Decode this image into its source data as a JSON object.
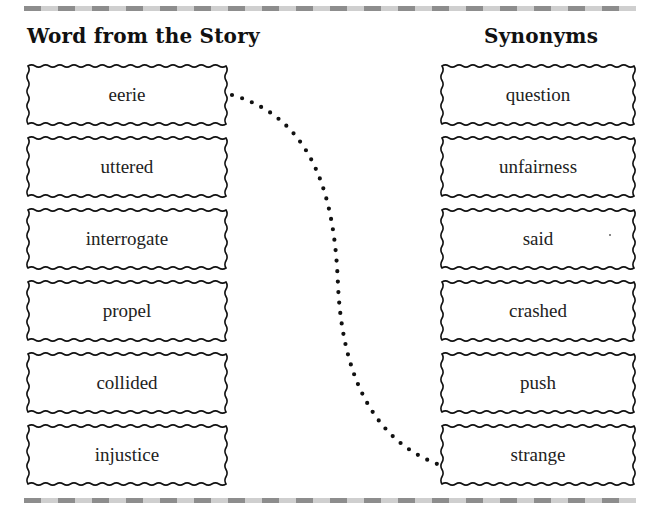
{
  "header": {
    "left_title": "Word from the Story",
    "right_title": "Synonyms"
  },
  "story_words": [
    {
      "label": "eerie"
    },
    {
      "label": "uttered"
    },
    {
      "label": "interrogate"
    },
    {
      "label": "propel"
    },
    {
      "label": "collided"
    },
    {
      "label": "injustice"
    }
  ],
  "synonyms": [
    {
      "label": "question"
    },
    {
      "label": "unfairness"
    },
    {
      "label": "said"
    },
    {
      "label": "crashed"
    },
    {
      "label": "push"
    },
    {
      "label": "strange"
    }
  ],
  "connections": [
    {
      "from": "eerie",
      "to": "strange",
      "style": "dotted"
    }
  ],
  "colors": {
    "stripe_dark": "#8d8d8d",
    "stripe_light": "#cfcfcf",
    "ink": "#111111"
  }
}
